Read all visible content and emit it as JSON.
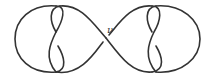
{
  "diagram": {
    "type": "knot-diagram",
    "crossing_label": "ν",
    "stroke_color": "#333333",
    "background": "#ffffff"
  }
}
